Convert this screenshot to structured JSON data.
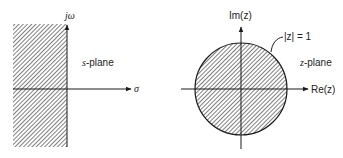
{
  "left_diagram": {
    "vertical_axis_label": "jω",
    "horizontal_axis_label": "σ",
    "plane_label_var": "s",
    "plane_label_suffix": "-plane",
    "shaded_region": "left half-plane"
  },
  "right_diagram": {
    "vertical_axis_label": "Im(z)",
    "horizontal_axis_label": "Re(z)",
    "circle_label": "|z| = 1",
    "plane_label_var": "z",
    "plane_label_suffix": "-plane",
    "shaded_region": "unit circle interior"
  },
  "colors": {
    "line": "#1a1a1a",
    "hatch": "#3a3a3a",
    "background": "#ffffff"
  }
}
